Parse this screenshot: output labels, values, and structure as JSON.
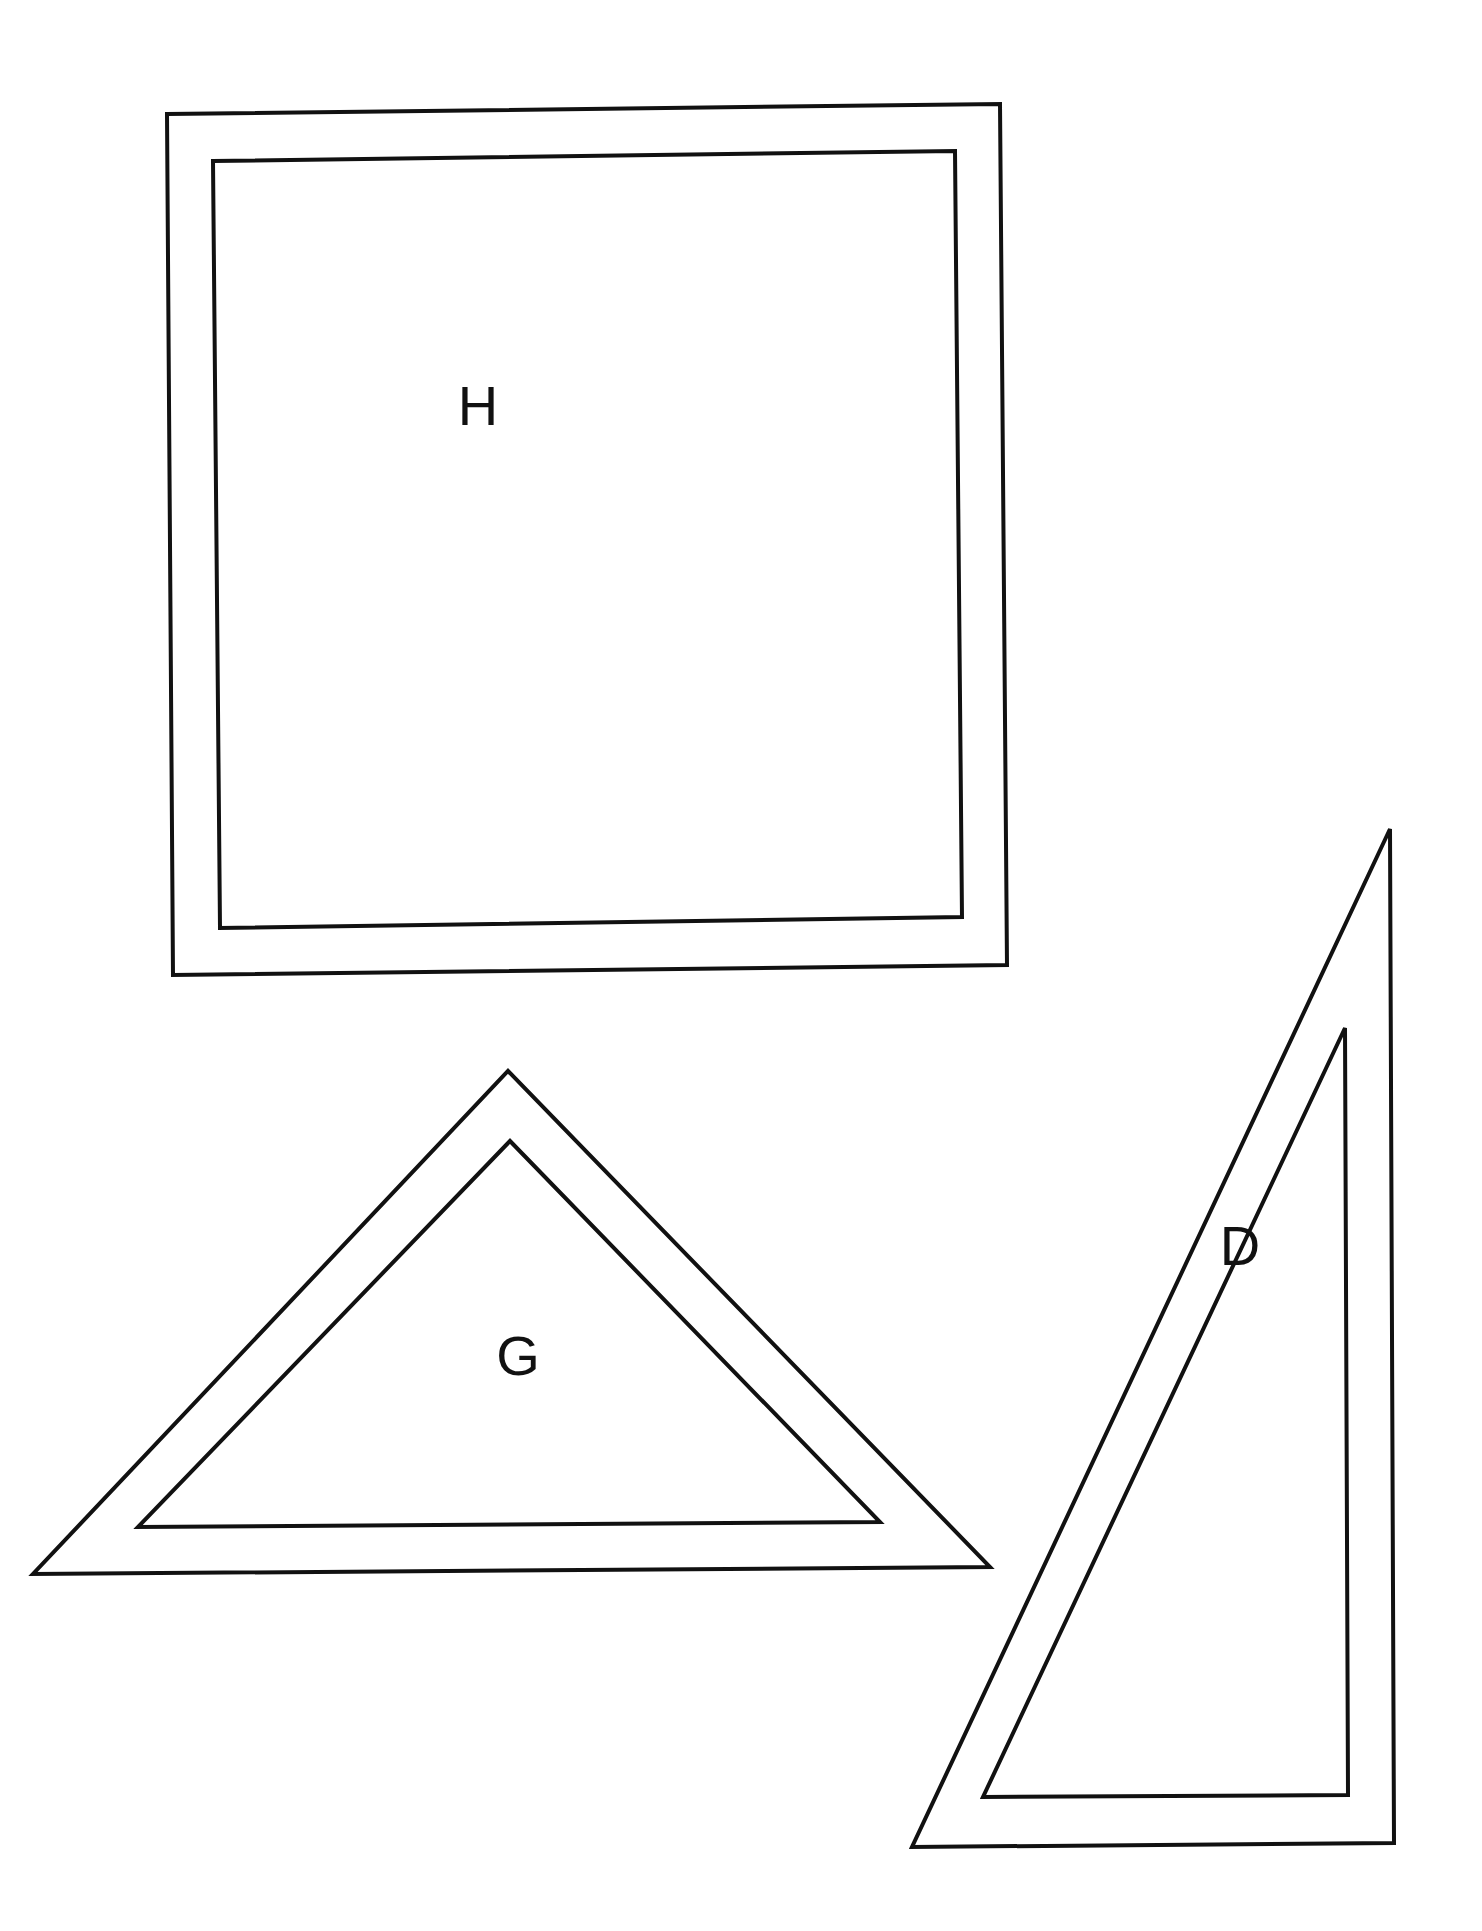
{
  "page": {
    "background_color": "#ffffff",
    "stroke_color": "#111111",
    "width": 1482,
    "height": 1931
  },
  "shapes": [
    {
      "id": "shape-h",
      "label": "H",
      "kind": "square",
      "description": "Double-outlined square (square frame)",
      "label_position": {
        "x": 478,
        "y": 410
      },
      "outer_points": "167,114 1000,104 1007,965 173,975",
      "inner_points": "213,161 955,151 962,917 220,928"
    },
    {
      "id": "shape-g",
      "label": "G",
      "kind": "triangle",
      "description": "Double-outlined isosceles triangle (triangular frame)",
      "label_position": {
        "x": 518,
        "y": 1360
      },
      "outer_points": "508,1071 990,1567 33,1574",
      "inner_points": "510,1141 880,1522 138,1527"
    },
    {
      "id": "shape-d",
      "label": "D",
      "kind": "triangle",
      "description": "Double-outlined right triangle (triangular frame)",
      "label_position": {
        "x": 1240,
        "y": 1250
      },
      "outer_points": "1390,829 1394,1843 912,1847",
      "inner_points": "1345,1028 1348,1795 983,1797"
    }
  ]
}
